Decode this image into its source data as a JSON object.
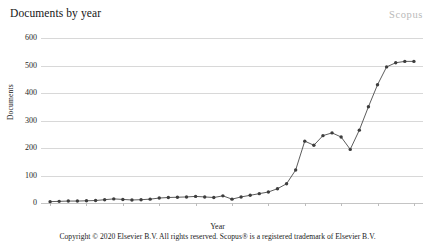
{
  "header": {
    "title": "Documents by year",
    "watermark": "Scopus"
  },
  "footer": {
    "copyright": "Copyright © 2020 Elsevier B.V. All rights reserved. Scopus® is a registered trademark of Elsevier B.V."
  },
  "colors": {
    "line": "#4a4a4a",
    "marker": "#3d3d3d",
    "grid": "#d8d8d8",
    "watermark": "#b9b9b9",
    "background": "#ffffff"
  },
  "chart_data": {
    "type": "line",
    "title": "Documents by year",
    "xlabel": "Year",
    "ylabel": "Documents",
    "xlim": [
      1979,
      2021
    ],
    "ylim": [
      0,
      600
    ],
    "yticks": [
      0,
      100,
      200,
      300,
      400,
      500,
      600
    ],
    "xticks": [
      1980,
      1984,
      1988,
      1992,
      1996,
      2000,
      2004,
      2008,
      2012,
      2016,
      2020
    ],
    "grid": true,
    "legend": false,
    "markers": true,
    "series": [
      {
        "name": "Documents",
        "x": [
          1980,
          1981,
          1982,
          1983,
          1984,
          1985,
          1986,
          1987,
          1988,
          1989,
          1990,
          1991,
          1992,
          1993,
          1994,
          1995,
          1996,
          1997,
          1998,
          1999,
          2000,
          2001,
          2002,
          2003,
          2004,
          2005,
          2006,
          2007,
          2008,
          2009,
          2010,
          2011,
          2012,
          2013,
          2014,
          2015,
          2016,
          2017,
          2018,
          2019,
          2020
        ],
        "values": [
          5,
          6,
          7,
          7,
          8,
          9,
          12,
          15,
          13,
          11,
          12,
          14,
          18,
          20,
          21,
          22,
          24,
          22,
          20,
          26,
          14,
          22,
          28,
          34,
          40,
          52,
          70,
          120,
          225,
          210,
          245,
          255,
          240,
          195,
          265,
          350,
          430,
          495,
          510,
          515,
          515
        ]
      }
    ]
  }
}
